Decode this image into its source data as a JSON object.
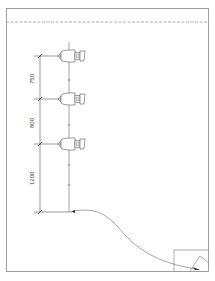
{
  "drawing": {
    "type": "elevation-dimension-drawing",
    "dimensions": [
      {
        "label": "750",
        "from_y": 56,
        "to_y": 99
      },
      {
        "label": "800",
        "from_y": 99,
        "to_y": 144
      },
      {
        "label": "1200",
        "from_y": 144,
        "to_y": 212
      }
    ],
    "fixtures": [
      {
        "name": "fixture-1",
        "y": 56
      },
      {
        "name": "fixture-2",
        "y": 99
      },
      {
        "name": "fixture-3",
        "y": 144
      }
    ],
    "colors": {
      "line": "#555555",
      "border": "#888888",
      "background": "#ffffff"
    }
  }
}
